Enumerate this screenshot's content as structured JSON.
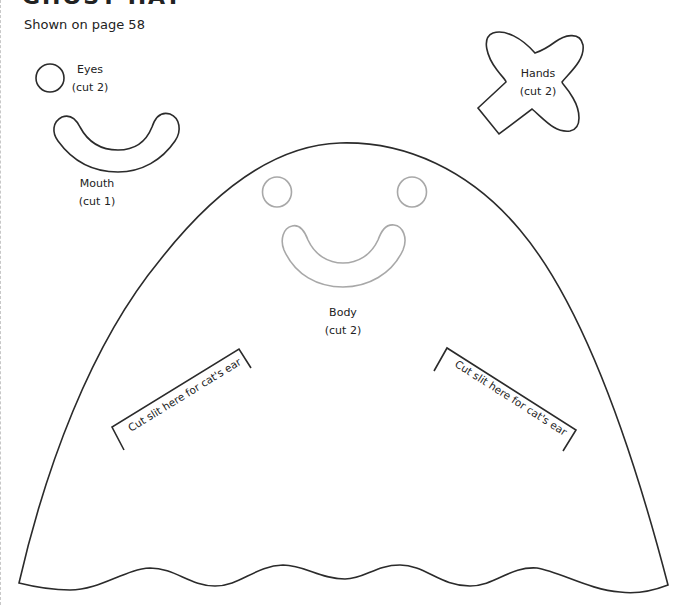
{
  "page": {
    "title": "GHOST HAT",
    "subtitle": "Shown on page 58"
  },
  "pieces": {
    "eyes": {
      "name": "Eyes",
      "cut": "(cut 2)"
    },
    "mouth": {
      "name": "Mouth",
      "cut": "(cut 1)"
    },
    "hands": {
      "name": "Hands",
      "cut": "(cut 2)"
    },
    "body": {
      "name": "Body",
      "cut": "(cut 2)"
    }
  },
  "slits": {
    "left": "Cut slit here for cat's ear",
    "right": "Cut slit here for cat's ear"
  },
  "colors": {
    "outline": "#2b2b2b",
    "face_guide": "#a8a8a8",
    "cut_line": "#c8c8c8"
  }
}
